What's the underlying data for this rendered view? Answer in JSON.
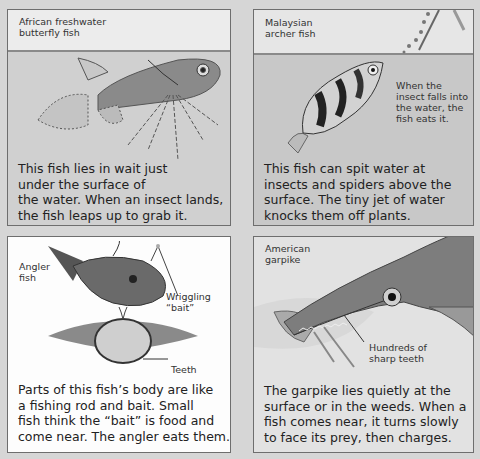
{
  "panels": [
    {
      "title": "African freshwater butterfly fish",
      "title_lines": [
        "African freshwater",
        "butterfly fish"
      ],
      "body_lines": [
        "This fish lies in wait just",
        "under the surface of",
        "the water. When an insect lands,",
        "the fish leaps up to grab it."
      ]
    },
    {
      "title": "Malaysian archer fish",
      "title_lines": [
        "Malaysian",
        "archer fish"
      ],
      "callout_lines": [
        "When the",
        "insect falls into",
        "the water, the",
        "fish eats it."
      ],
      "body_lines": [
        "This fish can spit water at",
        "insects and spiders above the",
        "surface. The tiny jet of water",
        "knocks them off plants."
      ]
    },
    {
      "title": "Angler fish",
      "title_lines": [
        "Angler",
        "fish"
      ],
      "callouts": {
        "bait_lines": [
          "Wriggling",
          "“bait”"
        ],
        "teeth": "Teeth"
      },
      "body_lines": [
        "Parts of this fish’s body are like",
        "a fishing rod and bait. Small",
        "fish think the “bait” is food and",
        "come near. The angler eats them."
      ]
    },
    {
      "title": "American garpike",
      "title_lines": [
        "American",
        "garpike"
      ],
      "callout_lines": [
        "Hundreds of",
        "sharp teeth"
      ],
      "body_lines": [
        "The garpike lies quietly at the",
        "surface or in the weeds. When a",
        "fish comes near, it turns slowly",
        "to face its prey, then charges."
      ]
    }
  ],
  "colors": {
    "page_background": "#d6d6d6",
    "panel_border": "#6e6e6e",
    "text": "#222222"
  }
}
